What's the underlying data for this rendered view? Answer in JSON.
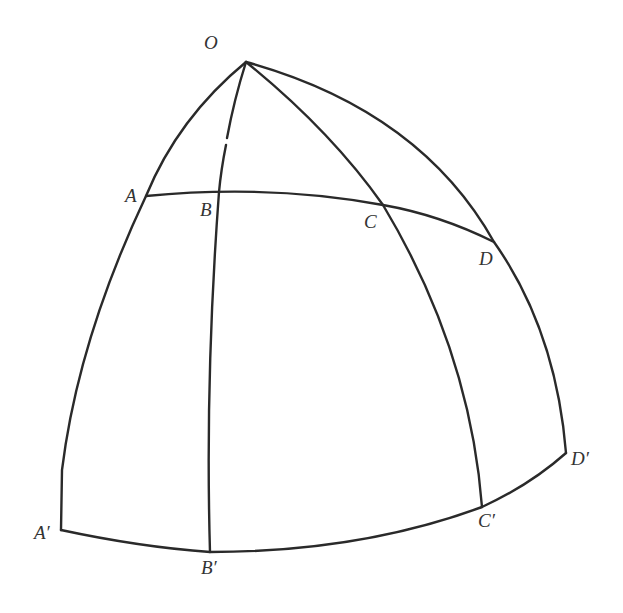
{
  "diagram": {
    "points": {
      "O": {
        "label": "O",
        "x": 246,
        "y": 62
      },
      "A": {
        "label": "A",
        "x": 146,
        "y": 196
      },
      "B": {
        "label": "B",
        "x": 219,
        "y": 192
      },
      "C": {
        "label": "C",
        "x": 383,
        "y": 205
      },
      "D": {
        "label": "D",
        "x": 494,
        "y": 242
      },
      "A_prime": {
        "label": "A′",
        "x": 61,
        "y": 530
      },
      "B_prime": {
        "label": "B′",
        "x": 210,
        "y": 552
      },
      "C_prime": {
        "label": "C′",
        "x": 482,
        "y": 507
      },
      "D_prime": {
        "label": "D′",
        "x": 566,
        "y": 453
      }
    },
    "curves": [
      {
        "name": "meridian-OA-A'",
        "from": "O",
        "via": "A",
        "to": "A′"
      },
      {
        "name": "meridian-OB-B'",
        "from": "O",
        "via": "B",
        "to": "B′"
      },
      {
        "name": "meridian-OC-C'",
        "from": "O",
        "via": "C",
        "to": "C′"
      },
      {
        "name": "meridian-OD-D'",
        "from": "O",
        "via": "D",
        "to": "D′"
      },
      {
        "name": "parallel-ABCD",
        "through": [
          "A",
          "B",
          "C",
          "D"
        ]
      },
      {
        "name": "base-A'B'C'D'",
        "through": [
          "A′",
          "B′",
          "C′",
          "D′"
        ]
      }
    ]
  }
}
